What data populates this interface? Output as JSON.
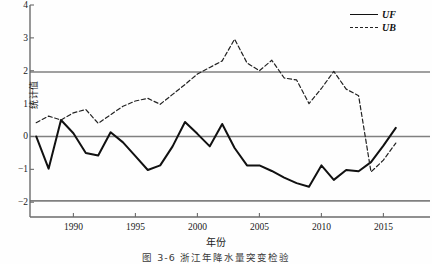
{
  "figure": {
    "caption": "图 3-6   浙江年降水量突变检验"
  },
  "legend": {
    "position": "top-right",
    "items": [
      {
        "label": "UF",
        "style": "solid"
      },
      {
        "label": "UB",
        "style": "dashed"
      }
    ]
  },
  "annotations": {
    "upper_p_label": "P=0.05",
    "lower_p_label": "P=0.05"
  },
  "chart_data": {
    "type": "line",
    "title": "",
    "xlabel": "年份",
    "ylabel": "统计值",
    "xlim": [
      1986.5,
      2016.5
    ],
    "ylim": [
      -2.45,
      4.0
    ],
    "grid": false,
    "xticks": [
      1990,
      1995,
      2000,
      2005,
      2010,
      2015
    ],
    "yticks": [
      -2,
      -1,
      0,
      1,
      2,
      3,
      4
    ],
    "reference_lines": [
      {
        "y": 1.96,
        "label": "P=0.05",
        "color": "#808080"
      },
      {
        "y": 0,
        "label": "",
        "color": "#808080"
      },
      {
        "y": -1.96,
        "label": "P=0.05",
        "color": "#808080"
      }
    ],
    "x": [
      1987,
      1988,
      1989,
      1990,
      1991,
      1992,
      1993,
      1994,
      1995,
      1996,
      1997,
      1998,
      1999,
      2000,
      2001,
      2002,
      2003,
      2004,
      2005,
      2006,
      2007,
      2008,
      2009,
      2010,
      2011,
      2012,
      2013,
      2014,
      2015,
      2016
    ],
    "series": [
      {
        "name": "UF",
        "style": "solid",
        "color": "#111111",
        "values": [
          0.0,
          -0.98,
          0.5,
          0.1,
          -0.5,
          -0.58,
          0.13,
          -0.18,
          -0.6,
          -1.02,
          -0.88,
          -0.3,
          0.44,
          0.08,
          -0.3,
          0.38,
          -0.35,
          -0.88,
          -0.88,
          -1.05,
          -1.25,
          -1.42,
          -1.53,
          -0.88,
          -1.32,
          -1.02,
          -1.06,
          -0.78,
          -0.28,
          0.26
        ]
      },
      {
        "name": "UB",
        "style": "dashed",
        "color": "#222222",
        "values": [
          0.42,
          0.62,
          0.5,
          0.72,
          0.82,
          0.4,
          0.66,
          0.92,
          1.08,
          1.16,
          0.98,
          1.28,
          1.58,
          1.9,
          2.1,
          2.3,
          2.96,
          2.24,
          2.0,
          2.32,
          1.78,
          1.72,
          1.0,
          1.46,
          1.98,
          1.44,
          1.24,
          -1.08,
          -0.72,
          -0.2
        ]
      }
    ]
  }
}
